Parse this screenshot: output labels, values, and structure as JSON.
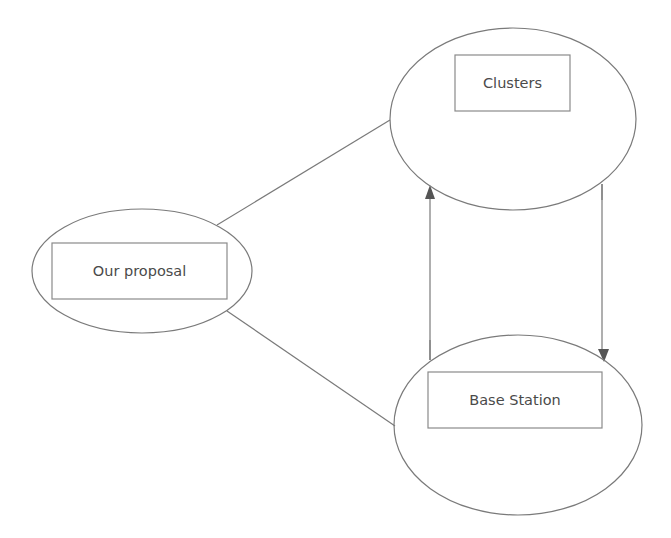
{
  "diagram": {
    "nodes": {
      "clusters": {
        "label": "Clusters"
      },
      "proposal": {
        "label": "Our proposal"
      },
      "base_station": {
        "label": "Base Station"
      }
    },
    "edges": [
      {
        "from": "proposal",
        "to": "clusters",
        "type": "line"
      },
      {
        "from": "proposal",
        "to": "base_station",
        "type": "line"
      },
      {
        "from": "base_station",
        "to": "clusters",
        "type": "arrow"
      },
      {
        "from": "clusters",
        "to": "base_station",
        "type": "arrow"
      }
    ],
    "colors": {
      "stroke": "#7a7a7a",
      "text": "#4a4a4a",
      "arrowhead": "#555555"
    }
  }
}
